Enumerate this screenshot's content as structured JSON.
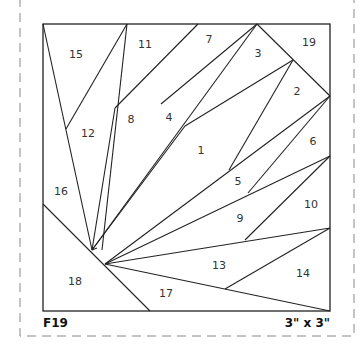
{
  "pattern": {
    "id_label": "F19",
    "size_label": "3\" x 3\"",
    "pieces": [
      {
        "n": "1",
        "x": 201,
        "y": 154
      },
      {
        "n": "2",
        "x": 297,
        "y": 95
      },
      {
        "n": "3",
        "x": 258,
        "y": 57
      },
      {
        "n": "4",
        "x": 169,
        "y": 121
      },
      {
        "n": "5",
        "x": 238,
        "y": 185
      },
      {
        "n": "6",
        "x": 313,
        "y": 145
      },
      {
        "n": "7",
        "x": 209,
        "y": 43
      },
      {
        "n": "8",
        "x": 131,
        "y": 123
      },
      {
        "n": "9",
        "x": 240,
        "y": 222
      },
      {
        "n": "10",
        "x": 311,
        "y": 208
      },
      {
        "n": "11",
        "x": 145,
        "y": 48
      },
      {
        "n": "12",
        "x": 88,
        "y": 137
      },
      {
        "n": "13",
        "x": 219,
        "y": 269
      },
      {
        "n": "14",
        "x": 303,
        "y": 277
      },
      {
        "n": "15",
        "x": 76,
        "y": 58
      },
      {
        "n": "16",
        "x": 61,
        "y": 195
      },
      {
        "n": "17",
        "x": 166,
        "y": 297
      },
      {
        "n": "18",
        "x": 75,
        "y": 285
      },
      {
        "n": "19",
        "x": 309,
        "y": 46
      }
    ]
  }
}
